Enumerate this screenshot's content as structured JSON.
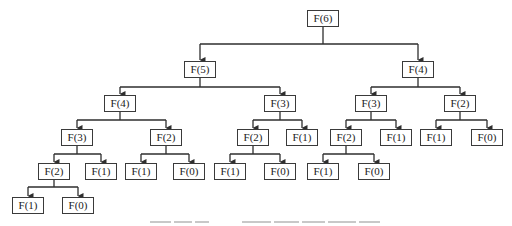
{
  "diagram": {
    "type": "recursion-tree",
    "line_color": "#2e2e2e",
    "box_border_color": "#3a3a3a",
    "text_color": "#222222",
    "nodes": [
      {
        "id": "n0",
        "label": "F(6)",
        "cx": 323,
        "y": 10,
        "w": 30,
        "parent": null
      },
      {
        "id": "n1",
        "label": "F(5)",
        "cx": 200,
        "y": 61,
        "w": 30,
        "parent": "n0"
      },
      {
        "id": "n2",
        "label": "F(4)",
        "cx": 418,
        "y": 61,
        "w": 30,
        "parent": "n0"
      },
      {
        "id": "n3",
        "label": "F(4)",
        "cx": 120,
        "y": 95,
        "w": 30,
        "parent": "n1"
      },
      {
        "id": "n4",
        "label": "F(3)",
        "cx": 280,
        "y": 95,
        "w": 30,
        "parent": "n1"
      },
      {
        "id": "n5",
        "label": "F(3)",
        "cx": 371,
        "y": 95,
        "w": 30,
        "parent": "n2"
      },
      {
        "id": "n6",
        "label": "F(2)",
        "cx": 460,
        "y": 95,
        "w": 30,
        "parent": "n2"
      },
      {
        "id": "n7",
        "label": "F(3)",
        "cx": 77,
        "y": 129,
        "w": 30,
        "parent": "n3"
      },
      {
        "id": "n8",
        "label": "F(2)",
        "cx": 166,
        "y": 129,
        "w": 30,
        "parent": "n3"
      },
      {
        "id": "n9",
        "label": "F(2)",
        "cx": 253,
        "y": 129,
        "w": 30,
        "parent": "n4"
      },
      {
        "id": "n10",
        "label": "F(1)",
        "cx": 302,
        "y": 129,
        "w": 30,
        "parent": "n4"
      },
      {
        "id": "n11",
        "label": "F(2)",
        "cx": 346,
        "y": 129,
        "w": 30,
        "parent": "n5"
      },
      {
        "id": "n12",
        "label": "F(1)",
        "cx": 396,
        "y": 129,
        "w": 30,
        "parent": "n5"
      },
      {
        "id": "n13",
        "label": "F(1)",
        "cx": 436,
        "y": 129,
        "w": 30,
        "parent": "n6"
      },
      {
        "id": "n14",
        "label": "F(0)",
        "cx": 487,
        "y": 129,
        "w": 30,
        "parent": "n6"
      },
      {
        "id": "n15",
        "label": "F(2)",
        "cx": 54,
        "y": 163,
        "w": 30,
        "parent": "n7"
      },
      {
        "id": "n16",
        "label": "F(1)",
        "cx": 101,
        "y": 163,
        "w": 30,
        "parent": "n7"
      },
      {
        "id": "n17",
        "label": "F(1)",
        "cx": 141,
        "y": 163,
        "w": 30,
        "parent": "n8"
      },
      {
        "id": "n18",
        "label": "F(0)",
        "cx": 189,
        "y": 163,
        "w": 30,
        "parent": "n8"
      },
      {
        "id": "n19",
        "label": "F(1)",
        "cx": 230,
        "y": 163,
        "w": 30,
        "parent": "n9"
      },
      {
        "id": "n20",
        "label": "F(0)",
        "cx": 280,
        "y": 163,
        "w": 30,
        "parent": "n9"
      },
      {
        "id": "n21",
        "label": "F(1)",
        "cx": 323,
        "y": 163,
        "w": 30,
        "parent": "n11"
      },
      {
        "id": "n22",
        "label": "F(0)",
        "cx": 374,
        "y": 163,
        "w": 30,
        "parent": "n11"
      },
      {
        "id": "n23",
        "label": "F(1)",
        "cx": 28,
        "y": 197,
        "w": 30,
        "parent": "n15"
      },
      {
        "id": "n24",
        "label": "F(0)",
        "cx": 78,
        "y": 197,
        "w": 30,
        "parent": "n15"
      }
    ],
    "bus_y": {
      "n0": 44,
      "n1": 87,
      "n2": 87,
      "n3": 120,
      "n4": 120,
      "n5": 120,
      "n6": 120,
      "n7": 154,
      "n8": 154,
      "n9": 154,
      "n11": 154,
      "n15": 187
    }
  }
}
